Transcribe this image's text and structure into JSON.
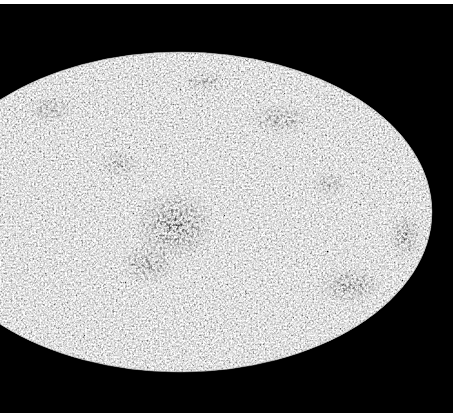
{
  "image": {
    "subject": "All-sky map in elliptical (Mollweide-style) projection, grayscale mottled noise pattern",
    "colors": {
      "background": "#000000",
      "page": "#ffffff",
      "map_light": "#d9d9d9",
      "map_dark": "#1a1a1a"
    },
    "ellipse": {
      "cx": 180,
      "cy": 208,
      "rx": 252,
      "ry": 160
    },
    "dark_regions": [
      {
        "name": "central-cold-region",
        "cx": 175,
        "cy": 222,
        "rx": 42,
        "ry": 36,
        "opacity": 0.55
      },
      {
        "name": "lower-center-region",
        "cx": 148,
        "cy": 260,
        "rx": 28,
        "ry": 20,
        "opacity": 0.4
      },
      {
        "name": "upper-right-region",
        "cx": 280,
        "cy": 115,
        "rx": 30,
        "ry": 16,
        "opacity": 0.35
      },
      {
        "name": "right-edge-region",
        "cx": 405,
        "cy": 232,
        "rx": 16,
        "ry": 22,
        "opacity": 0.5
      },
      {
        "name": "lower-right-region",
        "cx": 350,
        "cy": 282,
        "rx": 32,
        "ry": 18,
        "opacity": 0.45
      },
      {
        "name": "upper-left-region",
        "cx": 50,
        "cy": 105,
        "rx": 24,
        "ry": 14,
        "opacity": 0.3
      },
      {
        "name": "upper-center-region",
        "cx": 205,
        "cy": 78,
        "rx": 22,
        "ry": 10,
        "opacity": 0.3
      }
    ]
  }
}
